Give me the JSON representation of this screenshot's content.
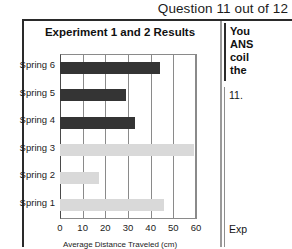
{
  "header": {
    "title": "Question 11 out of 12"
  },
  "chart_data": {
    "type": "bar",
    "orientation": "horizontal",
    "title": "Experiment 1 and 2 Results",
    "xlabel": "Average Distance Traveled (cm)",
    "ylabel": "",
    "xlim": [
      0,
      60
    ],
    "xticks": [
      0,
      10,
      20,
      30,
      40,
      50,
      60
    ],
    "grid": true,
    "legend": "none",
    "categories": [
      "Spring 1",
      "Spring 2",
      "Spring 3",
      "Spring 4",
      "Spring 5",
      "Spring 6"
    ],
    "values": [
      46,
      17,
      59,
      33,
      29,
      44
    ],
    "bar_styles": [
      "light",
      "light",
      "light",
      "dark",
      "dark",
      "dark"
    ],
    "colors": {
      "dark_bar": "#343434",
      "light_bar": "#d9d9d9",
      "gridline": "#8a8a8a",
      "axis": "#4a4a4a"
    },
    "rows_top_to_bottom": [
      {
        "label": "Spring 6",
        "value": 44,
        "style": "dark"
      },
      {
        "label": "Spring 5",
        "value": 29,
        "style": "dark"
      },
      {
        "label": "Spring 4",
        "value": 33,
        "style": "dark"
      },
      {
        "label": "Spring 3",
        "value": 59,
        "style": "light"
      },
      {
        "label": "Spring 2",
        "value": 17,
        "style": "light"
      },
      {
        "label": "Spring 1",
        "value": 46,
        "style": "light"
      }
    ]
  },
  "right_panel": {
    "instruction_lines": [
      "You",
      "ANS",
      "coil",
      "the"
    ],
    "question_number": "11.",
    "choice_lines": [
      "",
      "",
      "",
      ""
    ],
    "footer": "Exp"
  }
}
